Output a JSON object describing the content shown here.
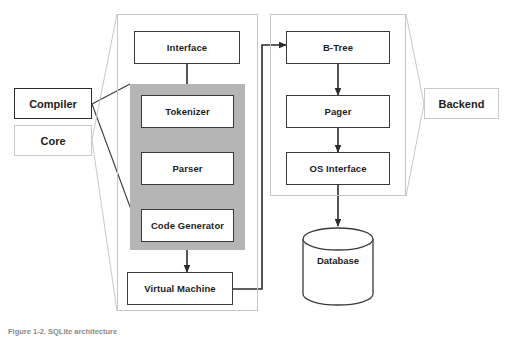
{
  "figure": {
    "caption": "Figure 1-2. SQLite architecture",
    "title": "SQLite architecture"
  },
  "containers": [
    {
      "id": "core-container",
      "name": "Core"
    },
    {
      "id": "backend-container",
      "name": "Backend"
    }
  ],
  "shaded_region": {
    "name": "Compiler"
  },
  "callouts": [
    {
      "id": "compiler",
      "label": "Compiler",
      "style": "strong"
    },
    {
      "id": "core",
      "label": "Core",
      "style": "faint"
    },
    {
      "id": "backend",
      "label": "Backend",
      "style": "faint"
    }
  ],
  "nodes": [
    {
      "id": "interface",
      "label": "Interface",
      "group": "core"
    },
    {
      "id": "tokenizer",
      "label": "Tokenizer",
      "group": "compiler"
    },
    {
      "id": "parser",
      "label": "Parser",
      "group": "compiler"
    },
    {
      "id": "code-generator",
      "label": "Code Generator",
      "group": "compiler"
    },
    {
      "id": "virtual-machine",
      "label": "Virtual Machine",
      "group": "core"
    },
    {
      "id": "b-tree",
      "label": "B-Tree",
      "group": "backend"
    },
    {
      "id": "pager",
      "label": "Pager",
      "group": "backend"
    },
    {
      "id": "os-interface",
      "label": "OS Interface",
      "group": "backend"
    }
  ],
  "datastore": {
    "id": "database",
    "label": "Database",
    "shape": "cylinder"
  },
  "edges": [
    {
      "from": "interface",
      "to": "tokenizer"
    },
    {
      "from": "tokenizer",
      "to": "parser"
    },
    {
      "from": "parser",
      "to": "code-generator"
    },
    {
      "from": "code-generator",
      "to": "virtual-machine"
    },
    {
      "from": "virtual-machine",
      "to": "b-tree"
    },
    {
      "from": "b-tree",
      "to": "pager"
    },
    {
      "from": "pager",
      "to": "os-interface"
    },
    {
      "from": "os-interface",
      "to": "database"
    }
  ],
  "colors": {
    "shade": "#b5b5b5",
    "container_border": "#c6c6c6",
    "node_border": "#3a3a3a",
    "arrow": "#2b2b2b",
    "text": "#1d1d1d",
    "caption": "#8a8a8a"
  }
}
